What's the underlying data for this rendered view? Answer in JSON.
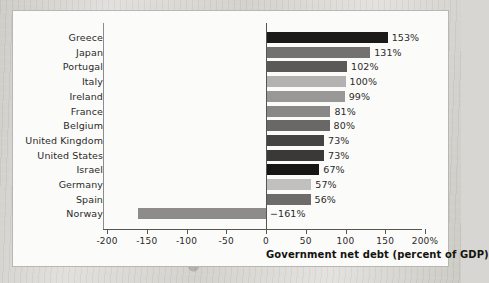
{
  "figure": {
    "panel_background": "#fbfbfa",
    "panel_border_color": "#b9b7b3"
  },
  "chart_data": {
    "type": "bar",
    "orientation": "horizontal",
    "title": "",
    "xlabel": "Government net debt (percent of GDP)",
    "ylabel": "",
    "xlim": [
      -200,
      200
    ],
    "xticks": [
      -200,
      -150,
      -100,
      -50,
      0,
      50,
      100,
      150,
      200
    ],
    "xtick_labels": [
      "-200",
      "-150",
      "-100",
      "-50",
      "0",
      "50",
      "100",
      "150",
      "200%"
    ],
    "grid": false,
    "legend": null,
    "zero_line": 0,
    "categories": [
      "Greece",
      "Japan",
      "Portugal",
      "Italy",
      "Ireland",
      "France",
      "Belgium",
      "United Kingdom",
      "United States",
      "Israel",
      "Germany",
      "Spain",
      "Norway"
    ],
    "values": [
      153,
      131,
      102,
      100,
      99,
      81,
      80,
      73,
      73,
      67,
      57,
      56,
      -161
    ],
    "value_labels": [
      "153%",
      "131%",
      "102%",
      "100%",
      "99%",
      "81%",
      "80%",
      "73%",
      "73%",
      "67%",
      "57%",
      "56%",
      "−161%"
    ],
    "bar_colors": [
      "#1b1a19",
      "#747271",
      "#5b5957",
      "#b4b2b0",
      "#9a9896",
      "#8a8886",
      "#6a6866",
      "#464442",
      "#3b3937",
      "#171614",
      "#c2c0be",
      "#6e6c6a",
      "#8e8c8a"
    ]
  }
}
